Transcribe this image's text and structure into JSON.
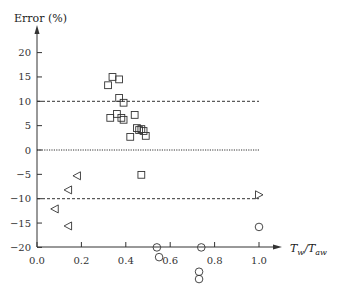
{
  "chart_data": {
    "type": "scatter",
    "title": "",
    "ylabel": "Error (%)",
    "xlabel": "T_w/T_aw",
    "xlim": [
      0.0,
      1.0
    ],
    "ylim": [
      -20,
      20
    ],
    "xticks": [
      "0.0",
      "0.2",
      "0.4",
      "0.6",
      "0.8",
      "1.0"
    ],
    "yticks": [
      "20",
      "15",
      "10",
      "5",
      "0",
      "-5",
      "-10",
      "-15",
      "-20"
    ],
    "grid": false,
    "reference_lines": [
      {
        "y": 10,
        "style": "dashed"
      },
      {
        "y": 0,
        "style": "dotted"
      },
      {
        "y": -10,
        "style": "dashed"
      }
    ],
    "series": [
      {
        "name": "squares",
        "marker": "square",
        "points": [
          [
            0.32,
            13.3
          ],
          [
            0.34,
            15.0
          ],
          [
            0.37,
            14.5
          ],
          [
            0.37,
            10.7
          ],
          [
            0.39,
            9.7
          ],
          [
            0.33,
            6.6
          ],
          [
            0.36,
            7.4
          ],
          [
            0.38,
            6.6
          ],
          [
            0.39,
            6.2
          ],
          [
            0.44,
            7.2
          ],
          [
            0.45,
            4.5
          ],
          [
            0.46,
            4.1
          ],
          [
            0.47,
            4.3
          ],
          [
            0.48,
            3.9
          ],
          [
            0.42,
            2.7
          ],
          [
            0.49,
            2.9
          ],
          [
            0.47,
            -5.1
          ]
        ]
      },
      {
        "name": "left-triangles",
        "marker": "triangle-left",
        "points": [
          [
            0.18,
            -5.3
          ],
          [
            0.14,
            -8.2
          ],
          [
            0.08,
            -12.1
          ],
          [
            0.14,
            -15.6
          ]
        ]
      },
      {
        "name": "right-triangles",
        "marker": "triangle-right",
        "points": [
          [
            1.0,
            -9.2
          ]
        ]
      },
      {
        "name": "circles",
        "marker": "circle",
        "points": [
          [
            0.54,
            -20.0
          ],
          [
            0.55,
            -22.0
          ],
          [
            0.74,
            -20.0
          ],
          [
            0.73,
            -25.0
          ],
          [
            0.73,
            -26.5
          ],
          [
            1.0,
            -15.8
          ]
        ]
      }
    ]
  },
  "labels": {
    "ylabel": "Error (%)",
    "xlabel_main": "T",
    "xlabel_sub1": "w",
    "xlabel_sep": "/",
    "xlabel_main2": "T",
    "xlabel_sub2": "aw"
  }
}
